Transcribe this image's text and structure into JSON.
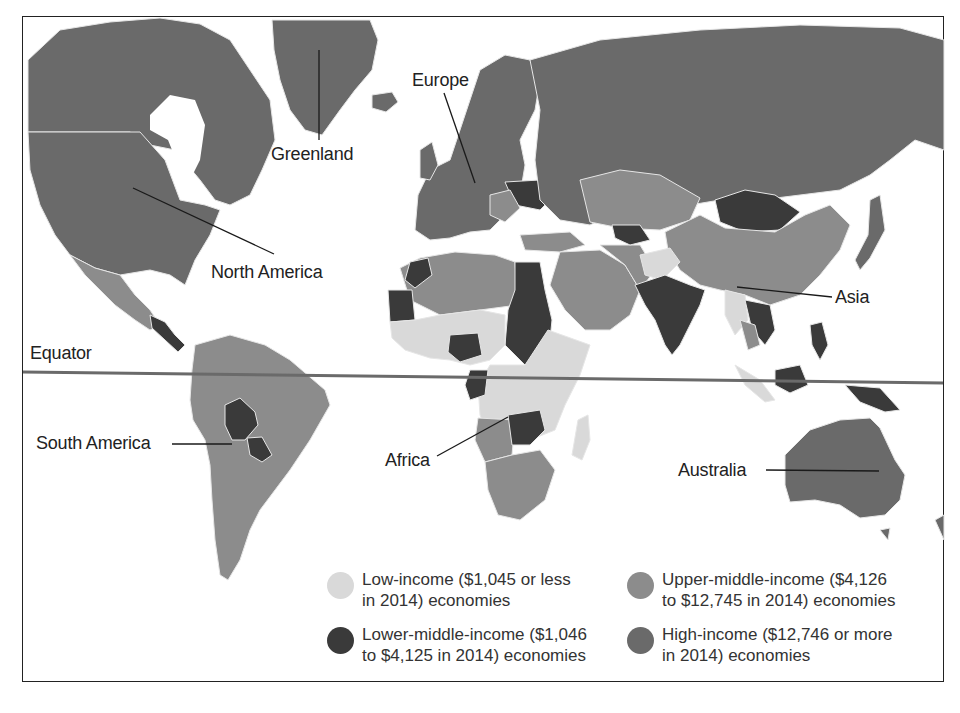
{
  "map": {
    "title": "",
    "colors": {
      "low_income": "#d9d9d9",
      "lower_middle_income": "#3a3a3a",
      "upper_middle_income": "#8c8c8c",
      "high_income": "#6a6a6a",
      "ocean": "#ffffff",
      "border": "#e8e8e8"
    },
    "labels": {
      "greenland": "Greenland",
      "europe": "Europe",
      "north_america": "North America",
      "asia": "Asia",
      "equator": "Equator",
      "south_america": "South America",
      "africa": "Africa",
      "australia": "Australia"
    },
    "legend": [
      {
        "category": "low",
        "label": "Low-income ($1,045 or less\nin 2014) economies",
        "color": "#d9d9d9"
      },
      {
        "category": "lower-middle",
        "label": "Lower-middle-income ($1,046\nto $4,125 in 2014) economies",
        "color": "#3a3a3a"
      },
      {
        "category": "upper-middle",
        "label": "Upper-middle-income ($4,126\nto $12,745 in 2014) economies",
        "color": "#8c8c8c"
      },
      {
        "category": "high",
        "label": "High-income ($12,746 or more\nin 2014) economies",
        "color": "#6a6a6a"
      }
    ]
  }
}
